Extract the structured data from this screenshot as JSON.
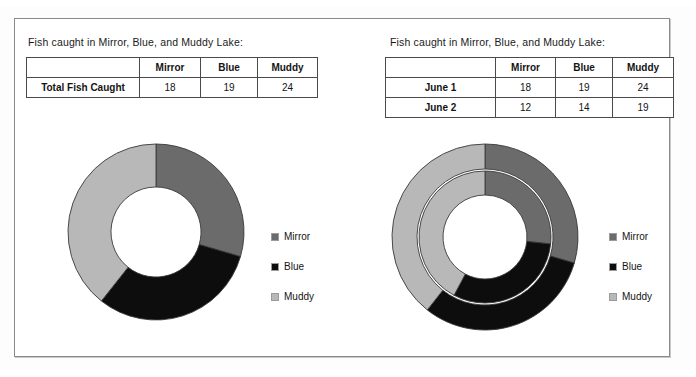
{
  "page": {
    "background_color": "#ffffff",
    "frame_border_color": "#8a8a8a"
  },
  "palette": {
    "mirror": "#6b6b6b",
    "blue": "#0d0d0d",
    "muddy": "#b8b8b8",
    "slice_outline": "#3a3a3a",
    "table_border": "#4a4a4a",
    "text": "#141414"
  },
  "left_panel": {
    "title": "Fish caught in Mirror, Blue, and Muddy Lake:",
    "table": {
      "headers": [
        "",
        "Mirror",
        "Blue",
        "Muddy"
      ],
      "rows": [
        {
          "label": "Total Fish Caught",
          "values": [
            "18",
            "19",
            "24"
          ]
        }
      ]
    },
    "legend": {
      "items": [
        {
          "label": "Mirror",
          "color": "#6b6b6b",
          "swatch": "legend-swatch-mirror"
        },
        {
          "label": "Blue",
          "color": "#0d0d0d",
          "swatch": "legend-swatch-blue"
        },
        {
          "label": "Muddy",
          "color": "#b8b8b8",
          "swatch": "legend-swatch-muddy"
        }
      ]
    }
  },
  "right_panel": {
    "title": "Fish caught in Mirror, Blue, and Muddy Lake:",
    "table": {
      "headers": [
        "",
        "Mirror",
        "Blue",
        "Muddy"
      ],
      "rows": [
        {
          "label": "June 1",
          "values": [
            "18",
            "19",
            "24"
          ]
        },
        {
          "label": "June 2",
          "values": [
            "12",
            "14",
            "19"
          ]
        }
      ]
    },
    "legend": {
      "items": [
        {
          "label": "Mirror",
          "color": "#6b6b6b",
          "swatch": "legend-swatch-mirror"
        },
        {
          "label": "Blue",
          "color": "#0d0d0d",
          "swatch": "legend-swatch-blue"
        },
        {
          "label": "Muddy",
          "color": "#b8b8b8",
          "swatch": "legend-swatch-muddy"
        }
      ]
    }
  },
  "chart_data": [
    {
      "type": "pie",
      "variant": "doughnut",
      "id": "left-doughnut",
      "title": "Fish caught in Mirror, Blue, and Muddy Lake:",
      "labels": [
        "Mirror",
        "Blue",
        "Muddy"
      ],
      "values": [
        18,
        19,
        24
      ],
      "total": 61,
      "colors": [
        "#6b6b6b",
        "#0d0d0d",
        "#b8b8b8"
      ],
      "start_angle_deg": 0,
      "direction": "clockwise",
      "legend_position": "right",
      "grid": false,
      "geometry": {
        "cx": 95,
        "cy": 95,
        "outer_r": 88,
        "inner_r": 45
      }
    },
    {
      "type": "pie",
      "variant": "doughnut-concentric",
      "id": "right-doughnut",
      "title": "Fish caught in Mirror, Blue, and Muddy Lake:",
      "labels": [
        "Mirror",
        "Blue",
        "Muddy"
      ],
      "colors": [
        "#6b6b6b",
        "#0d0d0d",
        "#b8b8b8"
      ],
      "series": [
        {
          "name": "June 1",
          "ring": "outer",
          "values": [
            18,
            19,
            24
          ],
          "total": 61
        },
        {
          "name": "June 2",
          "ring": "inner",
          "values": [
            12,
            14,
            19
          ],
          "total": 45
        }
      ],
      "start_angle_deg": 0,
      "direction": "clockwise",
      "legend_position": "right",
      "grid": false,
      "geometry": {
        "cx": 100,
        "cy": 100,
        "outer_ring": {
          "outer_r": 93,
          "inner_r": 68
        },
        "inner_ring": {
          "outer_r": 66,
          "inner_r": 42
        }
      }
    }
  ]
}
